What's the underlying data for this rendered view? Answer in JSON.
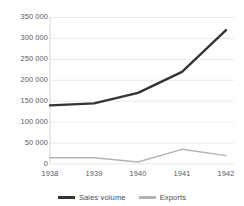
{
  "chart_data": {
    "type": "line",
    "title": "",
    "xlabel": "",
    "ylabel": "",
    "categories": [
      "1938",
      "1939",
      "1940",
      "1941",
      "1942"
    ],
    "x": [
      1938,
      1939,
      1940,
      1941,
      1942
    ],
    "series": [
      {
        "name": "Sales volume",
        "color": "#333333",
        "values": [
          140000,
          145000,
          170000,
          220000,
          320000
        ]
      },
      {
        "name": "Exports",
        "color": "#b3b3b3",
        "values": [
          15000,
          15000,
          5000,
          35000,
          20000
        ]
      }
    ],
    "ylim": [
      0,
      350000
    ],
    "yticks": [
      0,
      50000,
      100000,
      150000,
      200000,
      250000,
      300000,
      350000
    ],
    "ytick_labels": [
      "0",
      "50 000",
      "100 000",
      "150 000",
      "200 000",
      "250 000",
      "300 000",
      "350 000"
    ],
    "xtick_labels": [
      "1938",
      "1939",
      "1940",
      "1941",
      "1942"
    ],
    "grid": true,
    "grid_axis": "y",
    "grid_color": "#e3e3e3",
    "axis_color": "#d0d0d0",
    "legend_position": "bottom",
    "legend": [
      {
        "label": "Sales volume",
        "color": "#333333"
      },
      {
        "label": "Exports",
        "color": "#b3b3b3"
      }
    ]
  },
  "colors": {
    "background": "#ffffff",
    "sales_volume": "#333333",
    "exports": "#b3b3b3",
    "gridline": "#e3e3e3",
    "tick_text": "#59595b"
  }
}
